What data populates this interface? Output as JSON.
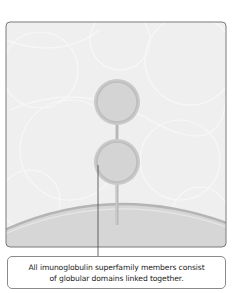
{
  "figure": {
    "panel": {
      "background": "#efefef",
      "border_color": "#7a7a7a",
      "membrane_fill": "#d9d9d9",
      "membrane_edge": "#b0b0b0"
    },
    "protein": {
      "domains": [
        {
          "label": "globular-domain-1",
          "fill": "#d2d2d2",
          "ring": "#b6b6b6"
        },
        {
          "label": "globular-domain-2",
          "fill": "#d2d2d2",
          "ring": "#b6b6b6"
        }
      ],
      "linker_color": "#b8b8b8"
    },
    "caption": {
      "line1": "All imunoglobulin superfamily members consist",
      "line2": "of globular domains linked together."
    }
  }
}
